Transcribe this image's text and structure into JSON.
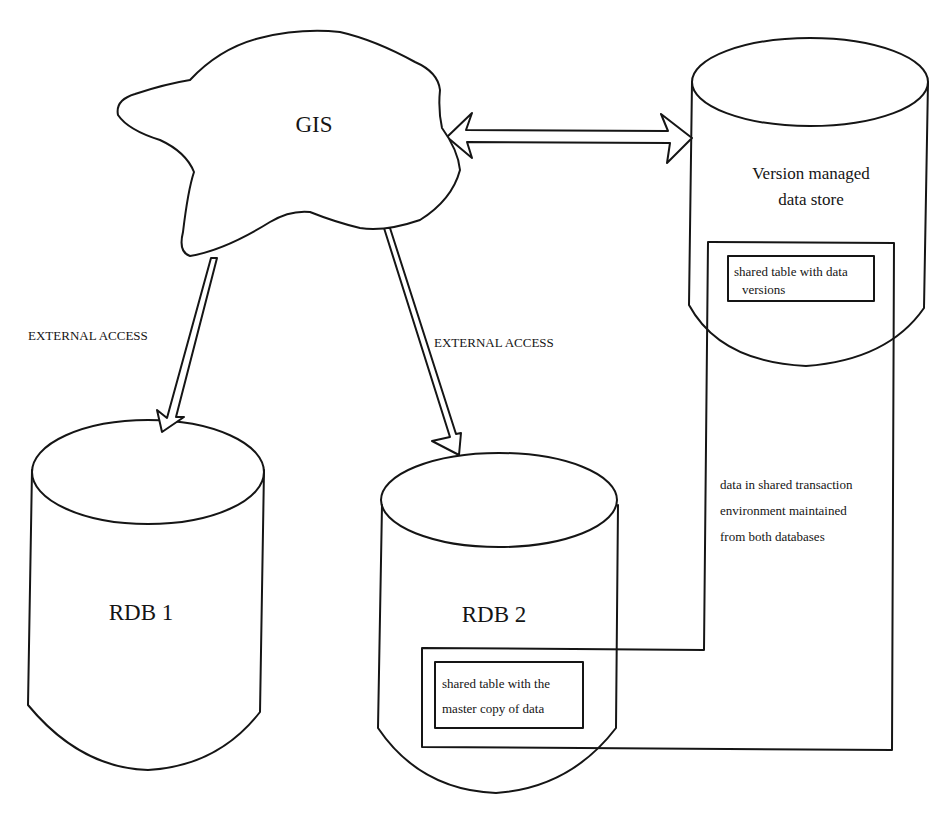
{
  "nodes": {
    "gis": {
      "label": "GIS"
    },
    "rdb1": {
      "label": "RDB 1"
    },
    "rdb2": {
      "label": "RDB 2",
      "inner_table": {
        "line1": "shared table with the",
        "line2": "master copy of data"
      }
    },
    "version_store": {
      "line1": "Version managed",
      "line2": "data store",
      "inner_table": {
        "line1": "shared table with data",
        "line2": "versions"
      }
    }
  },
  "edges": {
    "gis_to_rdb1": {
      "label": "EXTERNAL ACCESS",
      "type": "single-arrow"
    },
    "gis_to_rdb2": {
      "label": "EXTERNAL ACCESS",
      "type": "single-arrow"
    },
    "gis_to_version_store": {
      "label": "",
      "type": "double-arrow"
    }
  },
  "annotation": {
    "line1": "data in shared transaction",
    "line2": "environment maintained",
    "line3": "from both databases"
  },
  "colors": {
    "ink": "#151515",
    "background": "#ffffff"
  }
}
